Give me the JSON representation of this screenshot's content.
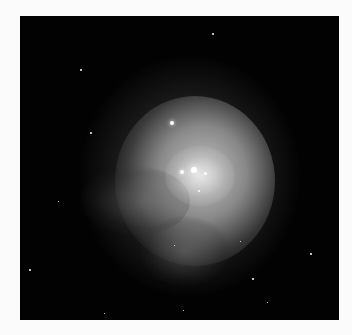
{
  "image": {
    "subject": "emission nebula",
    "description": "Grayscale astronomical photograph of a bright diffuse nebula with a central cluster of bright stars against a black star field",
    "colors": {
      "background_page": "#fbfbfb",
      "sky": "#020202",
      "nebula_core": "#d8d8d8"
    }
  }
}
